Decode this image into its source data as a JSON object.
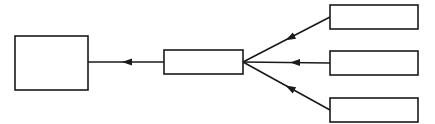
{
  "diagram": {
    "type": "flow",
    "stroke_color": "#1a1a1a",
    "background": "#ffffff",
    "nodes": [
      {
        "id": "target",
        "label": "",
        "x": 15,
        "y": 36,
        "w": 73,
        "h": 54
      },
      {
        "id": "hub",
        "label": "",
        "x": 164,
        "y": 50,
        "w": 79,
        "h": 24
      },
      {
        "id": "source-top",
        "label": "",
        "x": 330,
        "y": 5,
        "w": 88,
        "h": 24
      },
      {
        "id": "source-middle",
        "label": "",
        "x": 330,
        "y": 51,
        "w": 88,
        "h": 24
      },
      {
        "id": "source-bottom",
        "label": "",
        "x": 330,
        "y": 98,
        "w": 88,
        "h": 24
      }
    ],
    "edges": [
      {
        "from": "hub",
        "to": "target",
        "direction": "left"
      },
      {
        "from": "source-top",
        "to": "hub",
        "direction": "converge"
      },
      {
        "from": "source-middle",
        "to": "hub",
        "direction": "left"
      },
      {
        "from": "source-bottom",
        "to": "hub",
        "direction": "converge"
      }
    ]
  }
}
